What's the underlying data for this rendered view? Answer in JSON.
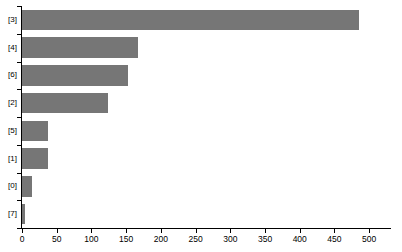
{
  "chart_data": {
    "type": "bar",
    "orientation": "horizontal",
    "title": "",
    "xlabel": "",
    "ylabel": "",
    "categories": [
      "[3]",
      "[4]",
      "[6]",
      "[2]",
      "[5]",
      "[1]",
      "[0]",
      "[7]"
    ],
    "values": [
      486,
      167,
      152,
      124,
      38,
      38,
      14,
      4
    ],
    "xlim": [
      0,
      530
    ],
    "ylim": [
      0,
      8
    ],
    "xticks": [
      0,
      50,
      100,
      150,
      200,
      250,
      300,
      350,
      400,
      450,
      500
    ],
    "xtick_labels": [
      "0",
      "50",
      "100",
      "150",
      "200",
      "250",
      "300",
      "350",
      "400",
      "450",
      "500"
    ],
    "grid": false,
    "legend": false,
    "legend_position": "none",
    "bar_color": "#767676",
    "axis_color": "#000000",
    "background_color": "#ffffff"
  }
}
